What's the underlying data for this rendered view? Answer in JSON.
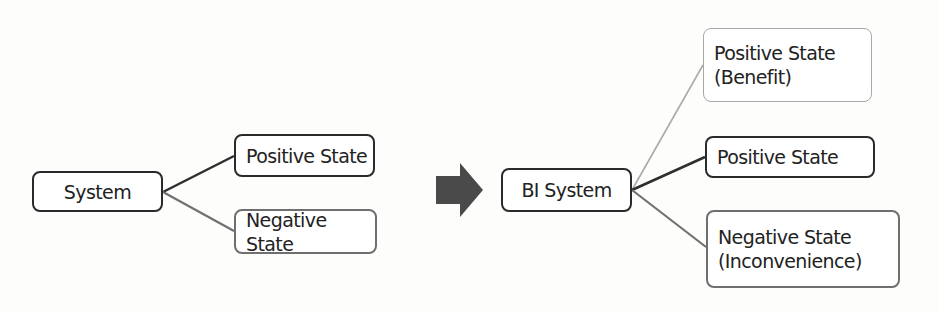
{
  "left_diagram": {
    "root": {
      "label": "System"
    },
    "children": [
      {
        "label": "Positive State",
        "tone": "dark"
      },
      {
        "label": "Negative State",
        "tone": "mid"
      }
    ]
  },
  "transition_arrow": {
    "icon": "right-arrow-icon",
    "color": "#4a4a4a"
  },
  "right_diagram": {
    "root": {
      "label": "BI System"
    },
    "children": [
      {
        "label": "Positive State\n(Benefit)",
        "tone": "light"
      },
      {
        "label": "Positive State",
        "tone": "dark"
      },
      {
        "label": "Negative State\n(Inconvenience)",
        "tone": "mid"
      }
    ]
  },
  "colors": {
    "dark": "#2a2a2a",
    "mid": "#6f6f6f",
    "light": "#a8a8a8",
    "background": "#fdfdfc"
  }
}
